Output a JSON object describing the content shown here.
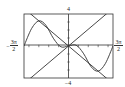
{
  "chart_data": {
    "type": "line",
    "title": "",
    "xlabel": "",
    "ylabel": "",
    "xlim_labels": [
      "-3π/2",
      "3π/2"
    ],
    "xlim": [
      -4.712,
      4.712
    ],
    "ylim": [
      -4,
      4
    ],
    "grid": false,
    "axis_ticks": true,
    "legend": null,
    "functions_note": "Exact functions are not confirmed; the formulas below are candidate readings of a small sketch.",
    "series": [
      {
        "name": "line rising",
        "formula_candidate": "y = x",
        "points": [
          [
            -4.712,
            -4.712
          ],
          [
            0,
            0
          ],
          [
            4.712,
            4.712
          ]
        ]
      },
      {
        "name": "line falling",
        "formula_candidate": "y = -x",
        "points": [
          [
            -4.712,
            4.712
          ],
          [
            0,
            0
          ],
          [
            4.712,
            -4.712
          ]
        ]
      },
      {
        "name": "oscillating curve",
        "formula_candidate": "unknown (cubic or sine-like shape, peak near (-1.6, 3.1))",
        "points": [
          [
            -4.712,
            0
          ],
          [
            -3.9,
            2.2
          ],
          [
            -3.14,
            3.14
          ],
          [
            -2.4,
            2.6
          ],
          [
            -1.57,
            0.9
          ],
          [
            -0.8,
            -0.1
          ],
          [
            0,
            0
          ],
          [
            0.8,
            0.1
          ],
          [
            1.57,
            -0.9
          ],
          [
            2.4,
            -2.6
          ],
          [
            3.14,
            -3.14
          ],
          [
            3.9,
            -2.2
          ],
          [
            4.712,
            0
          ]
        ]
      }
    ]
  },
  "labels": {
    "y_top": "4",
    "y_bottom": "−4",
    "x_left_sign": "−",
    "x_left_num": "3π",
    "x_left_den": "2",
    "x_right_num": "3π",
    "x_right_den": "2"
  }
}
